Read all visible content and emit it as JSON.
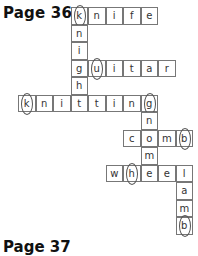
{
  "header": {
    "title": "Page 36"
  },
  "footer": {
    "title": "Page 37"
  },
  "grid": {
    "origin_x": 18,
    "origin_y": 7,
    "cell": 17.5
  },
  "cells": [
    {
      "r": 0,
      "c": 3,
      "ch": "k",
      "circled": true
    },
    {
      "r": 0,
      "c": 4,
      "ch": "n"
    },
    {
      "r": 0,
      "c": 5,
      "ch": "i"
    },
    {
      "r": 0,
      "c": 6,
      "ch": "f"
    },
    {
      "r": 0,
      "c": 7,
      "ch": "e"
    },
    {
      "r": 1,
      "c": 3,
      "ch": "n"
    },
    {
      "r": 2,
      "c": 3,
      "ch": "i"
    },
    {
      "r": 3,
      "c": 3,
      "ch": "g"
    },
    {
      "r": 3,
      "c": 4,
      "ch": "u",
      "circled": true
    },
    {
      "r": 3,
      "c": 5,
      "ch": "i"
    },
    {
      "r": 3,
      "c": 6,
      "ch": "t"
    },
    {
      "r": 3,
      "c": 7,
      "ch": "a"
    },
    {
      "r": 3,
      "c": 8,
      "ch": "r"
    },
    {
      "r": 4,
      "c": 3,
      "ch": "h"
    },
    {
      "r": 5,
      "c": 0,
      "ch": "k",
      "circled": true
    },
    {
      "r": 5,
      "c": 1,
      "ch": "n"
    },
    {
      "r": 5,
      "c": 2,
      "ch": "i"
    },
    {
      "r": 5,
      "c": 3,
      "ch": "t"
    },
    {
      "r": 5,
      "c": 4,
      "ch": "t"
    },
    {
      "r": 5,
      "c": 5,
      "ch": "i"
    },
    {
      "r": 5,
      "c": 6,
      "ch": "n"
    },
    {
      "r": 5,
      "c": 7,
      "ch": "g",
      "circled": true
    },
    {
      "r": 6,
      "c": 7,
      "ch": "n"
    },
    {
      "r": 7,
      "c": 6,
      "ch": "c"
    },
    {
      "r": 7,
      "c": 7,
      "ch": "o"
    },
    {
      "r": 7,
      "c": 8,
      "ch": "m"
    },
    {
      "r": 7,
      "c": 9,
      "ch": "b",
      "circled": true
    },
    {
      "r": 8,
      "c": 7,
      "ch": "m"
    },
    {
      "r": 9,
      "c": 5,
      "ch": "w"
    },
    {
      "r": 9,
      "c": 6,
      "ch": "h",
      "circled": true
    },
    {
      "r": 9,
      "c": 7,
      "ch": "e"
    },
    {
      "r": 9,
      "c": 8,
      "ch": "e"
    },
    {
      "r": 9,
      "c": 9,
      "ch": "l"
    },
    {
      "r": 10,
      "c": 9,
      "ch": "a"
    },
    {
      "r": 11,
      "c": 9,
      "ch": "m"
    },
    {
      "r": 12,
      "c": 9,
      "ch": "b",
      "circled": true
    }
  ]
}
